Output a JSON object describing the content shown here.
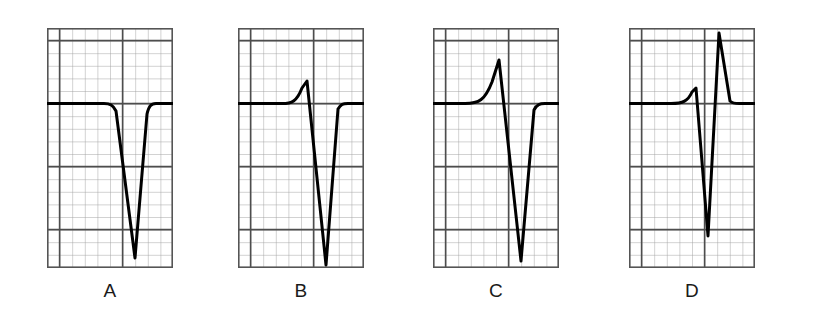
{
  "figure": {
    "background_color": "#ffffff",
    "panel_count": 4
  },
  "grid": {
    "minor_color": "#9a9a9a",
    "major_color": "#4d4d4d",
    "border_color": "#555555",
    "minor_cell_px": 12.6,
    "major_every": 5,
    "columns": 10,
    "rows": 19,
    "baseline_row": 6,
    "center_column": 6
  },
  "trace": {
    "color": "#000000",
    "stroke_width": 3.0
  },
  "panels": [
    {
      "id": "A",
      "label": "A",
      "name": "panel-a",
      "morphology": "QS",
      "description": "Deep negative QS complex with no initial R wave",
      "path": "M 0 75.6 L 57 75.6 C 63 75.6 66 77 69 83 L 88 230 L 100 86 C 102 78 104 75.6 109 75.6 L 126 75.6"
    },
    {
      "id": "B",
      "label": "B",
      "name": "panel-b",
      "morphology": "rS",
      "description": "Small initial r wave followed by a deep S wave",
      "path": "M 0 75.6 L 44 75.6 C 54 75.6 59 73 64 60 L 69 53 L 88 237 L 100 81 C 103 76 105 75.6 110 75.6 L 126 75.6"
    },
    {
      "id": "C",
      "label": "C",
      "name": "panel-c",
      "morphology": "RS",
      "description": "Tall R wave followed by a deep S wave",
      "path": "M 0 75.6 L 32 75.6 C 46 75.6 52 72 59 54 L 66 32 L 88 233 L 101 82 C 104 76 107 75.6 112 75.6 L 126 75.6"
    },
    {
      "id": "D",
      "label": "D",
      "name": "panel-d",
      "morphology": "rSR'",
      "description": "Small r wave, deep S wave, then a tall R prime wave",
      "path": "M 0 75.6 L 42 75.6 C 54 75.6 59 73 63 64 L 67 60 L 79 208 L 90 5 L 101 73 C 104 76 107 75.6 112 75.6 L 126 75.6"
    }
  ],
  "labels": {
    "font_size_px": 19,
    "color": "#1a1a1a"
  }
}
